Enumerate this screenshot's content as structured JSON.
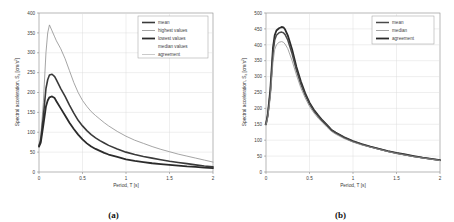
{
  "figure": {
    "panels": [
      {
        "id": "a",
        "caption": "(a)",
        "xlabel": "Period, T [s]",
        "ylabel_main": "Spectral acceleration, S",
        "ylabel_sub": "a",
        "ylabel_unit": " [cm/s",
        "ylabel_unit_sup": "2",
        "ylabel_unit_end": "]",
        "xticks": [
          "0",
          "0.5",
          "1",
          "1.5",
          "2"
        ],
        "yticks": [
          "0",
          "50",
          "100",
          "150",
          "200",
          "250",
          "300",
          "350",
          "400"
        ],
        "legend": [
          {
            "label": "mean",
            "color": "#3a3a3a",
            "width": 1.6
          },
          {
            "label": "highest values",
            "color": "#8e8e8e",
            "width": 0.8
          },
          {
            "label": "lowest values",
            "color": "#2b2b2b",
            "width": 1.8
          },
          {
            "label": "median values",
            "color": "#ffffff",
            "width": 0.0
          },
          {
            "label": "agreement",
            "color": "#bdbdbd",
            "width": 0.8
          }
        ]
      },
      {
        "id": "b",
        "caption": "(b)",
        "xlabel": "Period, T [s]",
        "ylabel_main": "Spectral acceleration, S",
        "ylabel_sub": "a",
        "ylabel_unit": " [cm/s",
        "ylabel_unit_sup": "2",
        "ylabel_unit_end": "]",
        "xticks": [
          "0",
          "0.5",
          "1",
          "1.5",
          "2"
        ],
        "yticks": [
          "0",
          "50",
          "100",
          "150",
          "200",
          "250",
          "300",
          "350",
          "400",
          "450",
          "500"
        ],
        "legend": [
          {
            "label": "mean",
            "color": "#4a4a4a",
            "width": 1.5
          },
          {
            "label": "median",
            "color": "#8e8e8e",
            "width": 0.8
          },
          {
            "label": "agreement",
            "color": "#2b2b2b",
            "width": 1.8
          }
        ]
      }
    ]
  },
  "chart_data": [
    {
      "type": "line",
      "panel": "a",
      "title": "",
      "xlabel": "Period, T [s]",
      "ylabel": "Spectral acceleration, Sa [cm/s2]",
      "xlim": [
        0,
        2
      ],
      "ylim": [
        0,
        400
      ],
      "xticks": [
        0,
        0.5,
        1,
        1.5,
        2
      ],
      "yticks": [
        0,
        50,
        100,
        150,
        200,
        250,
        300,
        350,
        400
      ],
      "grid": true,
      "legend_position": "top-right",
      "x": [
        0,
        0.02,
        0.05,
        0.08,
        0.1,
        0.12,
        0.15,
        0.18,
        0.2,
        0.25,
        0.3,
        0.35,
        0.4,
        0.45,
        0.5,
        0.55,
        0.6,
        0.65,
        0.7,
        0.75,
        0.8,
        0.9,
        1.0,
        1.1,
        1.2,
        1.3,
        1.4,
        1.5,
        1.6,
        1.7,
        1.8,
        1.9,
        2.0
      ],
      "series": [
        {
          "name": "highest values",
          "values": [
            68,
            90,
            175,
            300,
            350,
            370,
            355,
            340,
            330,
            310,
            285,
            255,
            225,
            200,
            180,
            165,
            152,
            142,
            133,
            124,
            116,
            102,
            90,
            80,
            72,
            64,
            57,
            51,
            45,
            40,
            35,
            30,
            25
          ]
        },
        {
          "name": "mean",
          "values": [
            66,
            80,
            140,
            210,
            232,
            244,
            246,
            240,
            232,
            210,
            190,
            168,
            148,
            130,
            116,
            104,
            94,
            86,
            79,
            73,
            67,
            58,
            50,
            44,
            39,
            35,
            31,
            27,
            24,
            21,
            18,
            15,
            13
          ]
        },
        {
          "name": "lowest values",
          "values": [
            64,
            74,
            118,
            165,
            180,
            188,
            190,
            186,
            178,
            160,
            142,
            124,
            108,
            94,
            82,
            72,
            64,
            58,
            53,
            48,
            44,
            38,
            32,
            28,
            25,
            22,
            20,
            18,
            16,
            14,
            13,
            11,
            10
          ]
        }
      ]
    },
    {
      "type": "line",
      "panel": "b",
      "title": "",
      "xlabel": "Period, T [s]",
      "ylabel": "Spectral acceleration, Sa [cm/s2]",
      "xlim": [
        0,
        2
      ],
      "ylim": [
        0,
        500
      ],
      "xticks": [
        0,
        0.5,
        1,
        1.5,
        2
      ],
      "yticks": [
        0,
        50,
        100,
        150,
        200,
        250,
        300,
        350,
        400,
        450,
        500
      ],
      "grid": true,
      "legend_position": "top-right",
      "x": [
        0,
        0.02,
        0.05,
        0.08,
        0.1,
        0.12,
        0.15,
        0.18,
        0.2,
        0.22,
        0.25,
        0.3,
        0.35,
        0.4,
        0.45,
        0.5,
        0.55,
        0.6,
        0.65,
        0.7,
        0.75,
        0.8,
        0.9,
        1.0,
        1.1,
        1.2,
        1.3,
        1.4,
        1.5,
        1.6,
        1.7,
        1.8,
        1.9,
        2.0
      ],
      "series": [
        {
          "name": "agreement",
          "values": [
            150,
            180,
            260,
            390,
            430,
            445,
            452,
            456,
            455,
            448,
            430,
            385,
            330,
            285,
            248,
            218,
            196,
            178,
            162,
            148,
            133,
            124,
            109,
            97,
            88,
            80,
            73,
            66,
            60,
            55,
            50,
            45,
            41,
            37
          ]
        },
        {
          "name": "mean",
          "values": [
            152,
            178,
            252,
            375,
            415,
            430,
            438,
            440,
            438,
            432,
            415,
            372,
            320,
            277,
            242,
            214,
            192,
            175,
            160,
            146,
            132,
            123,
            108,
            96,
            87,
            79,
            72,
            65,
            59,
            54,
            49,
            45,
            41,
            37
          ]
        },
        {
          "name": "median",
          "values": [
            148,
            170,
            235,
            345,
            385,
            400,
            408,
            410,
            408,
            402,
            388,
            350,
            305,
            265,
            233,
            206,
            186,
            169,
            155,
            141,
            128,
            119,
            105,
            94,
            85,
            78,
            71,
            64,
            58,
            53,
            48,
            44,
            40,
            36
          ]
        }
      ]
    }
  ]
}
